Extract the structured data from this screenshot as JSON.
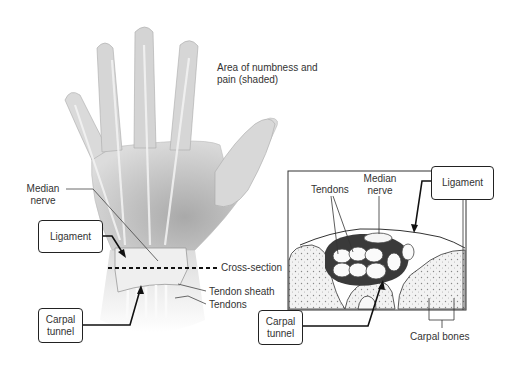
{
  "diagram": {
    "hand_view": {
      "annotation_area": "Area of numbness and pain (shaded)",
      "labels": {
        "median_nerve": "Median nerve",
        "cross_section": "Cross-section",
        "tendon_sheath": "Tendon sheath",
        "tendons": "Tendons"
      },
      "boxes": {
        "ligament": "Ligament",
        "carpal_tunnel": "Carpal tunnel"
      }
    },
    "cross_section_view": {
      "labels": {
        "tendons": "Tendons",
        "median_nerve": "Median nerve",
        "carpal_bones": "Carpal bones"
      },
      "boxes": {
        "ligament": "Ligament",
        "carpal_tunnel": "Carpal tunnel"
      }
    },
    "colors": {
      "line": "#222222",
      "text": "#333333",
      "hand_fill": "#e4e4e4",
      "hand_shade": "#bdbdbd",
      "bone_fill": "#ececec"
    }
  }
}
